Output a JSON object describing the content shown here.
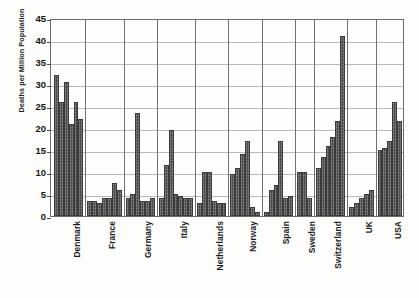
{
  "chart_data": {
    "type": "bar",
    "title": "",
    "xlabel": "",
    "ylabel": "Deaths per Million Population",
    "ylim": [
      0,
      45
    ],
    "ytick_step": 5,
    "yticks": [
      0,
      5,
      10,
      15,
      20,
      25,
      30,
      35,
      40,
      45
    ],
    "grid": "horizontal-and-group-separators",
    "legend": "none",
    "bar_color": "#595959",
    "frame_color": "#6b6b6b",
    "gridline_color": "#b9b9b9",
    "categories": [
      "Denmark",
      "France",
      "Germany",
      "Italy",
      "Netherlands",
      "Norway",
      "Spain",
      "Sweden",
      "Switzerland",
      "UK",
      "USA"
    ],
    "groups": [
      {
        "name": "Denmark",
        "values": [
          32.0,
          26.0,
          30.5,
          21.0,
          26.0,
          22.0
        ]
      },
      {
        "name": "France",
        "values": [
          3.5,
          3.5,
          3.0,
          4.0,
          4.0,
          7.5,
          6.0
        ]
      },
      {
        "name": "Germany",
        "values": [
          4.0,
          5.0,
          23.5,
          3.5,
          3.5,
          4.0
        ]
      },
      {
        "name": "Italy",
        "values": [
          4.0,
          11.5,
          19.5,
          5.0,
          4.5,
          4.0,
          4.0
        ]
      },
      {
        "name": "Netherlands",
        "values": [
          3.0,
          10.0,
          10.0,
          3.5,
          3.0,
          3.0
        ]
      },
      {
        "name": "Norway",
        "values": [
          9.5,
          11.0,
          14.0,
          17.0,
          2.0,
          1.0
        ]
      },
      {
        "name": "Spain",
        "values": [
          1.0,
          6.0,
          7.0,
          17.0,
          4.0,
          4.5
        ]
      },
      {
        "name": "Sweden",
        "values": [
          10.0,
          10.0,
          4.0
        ]
      },
      {
        "name": "Switzerland",
        "values": [
          11.0,
          13.5,
          16.0,
          18.0,
          21.5,
          41.0
        ]
      },
      {
        "name": "UK",
        "values": [
          2.0,
          3.0,
          4.0,
          5.0,
          6.0
        ]
      },
      {
        "name": "USA",
        "values": [
          15.0,
          15.5,
          17.0,
          26.0,
          21.5
        ]
      }
    ]
  }
}
